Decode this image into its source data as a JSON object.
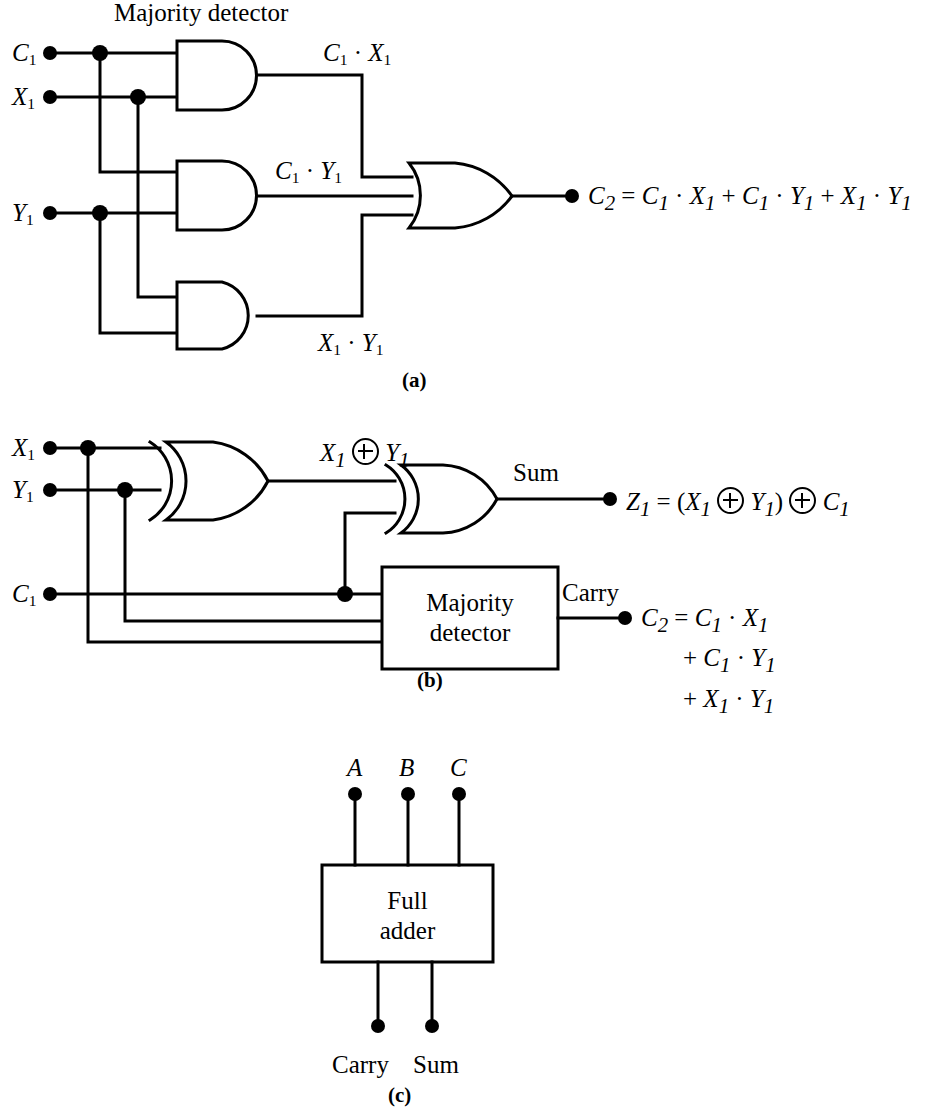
{
  "figure": {
    "title_a": "Majority detector",
    "parts": [
      {
        "id": "a",
        "label": "(a)"
      },
      {
        "id": "b",
        "label": "(b)"
      },
      {
        "id": "c",
        "label": "(c)"
      }
    ]
  },
  "part_a": {
    "heading": "Majority detector",
    "inputs": [
      {
        "name": "C",
        "sub": "1"
      },
      {
        "name": "X",
        "sub": "1"
      },
      {
        "name": "Y",
        "sub": "1"
      }
    ],
    "gates": [
      {
        "type": "AND",
        "output_label": "C₁ · X₁",
        "inputs": [
          "C₁",
          "X₁"
        ]
      },
      {
        "type": "AND",
        "output_label": "C₁ · Y₁",
        "inputs": [
          "C₁",
          "Y₁"
        ]
      },
      {
        "type": "AND",
        "output_label": "X₁ · Y₁",
        "inputs": [
          "X₁",
          "Y₁"
        ]
      },
      {
        "type": "OR",
        "output_label": "C₂",
        "inputs": [
          "C₁ · X₁",
          "C₁ · Y₁",
          "X₁ · Y₁"
        ]
      }
    ],
    "wire_labels": {
      "and1": {
        "a": "C",
        "a_sub": "1",
        "dot": "·",
        "b": "X",
        "b_sub": "1"
      },
      "and2": {
        "a": "C",
        "a_sub": "1",
        "dot": "·",
        "b": "Y",
        "b_sub": "1"
      },
      "and3": {
        "a": "X",
        "a_sub": "1",
        "dot": "·",
        "b": "Y",
        "b_sub": "1"
      }
    },
    "output_equation": {
      "lhs": "C",
      "lhs_sub": "2",
      "eq": "=",
      "terms": [
        {
          "a": "C",
          "a_sub": "1",
          "dot": "·",
          "b": "X",
          "b_sub": "1"
        },
        {
          "a": "C",
          "a_sub": "1",
          "dot": "·",
          "b": "Y",
          "b_sub": "1"
        },
        {
          "a": "X",
          "a_sub": "1",
          "dot": "·",
          "b": "Y",
          "b_sub": "1"
        }
      ],
      "plus": "+",
      "full_text": "C₂ = C₁ · X₁ + C₁ · Y₁ + X₁ · Y₁"
    },
    "part_label": "(a)"
  },
  "part_b": {
    "inputs": [
      {
        "name": "X",
        "sub": "1"
      },
      {
        "name": "Y",
        "sub": "1"
      },
      {
        "name": "C",
        "sub": "1"
      }
    ],
    "gates": [
      {
        "type": "XOR",
        "output_label": "X₁ ⊕ Y₁"
      },
      {
        "type": "XOR",
        "output_label": "Sum"
      }
    ],
    "block": {
      "line1": "Majority",
      "line2": "detector"
    },
    "wire_label_xor1": {
      "a": "X",
      "a_sub": "1",
      "b": "Y",
      "b_sub": "1"
    },
    "sum_label": "Sum",
    "carry_label": "Carry",
    "sum_equation": {
      "lhs": "Z",
      "lhs_sub": "1",
      "eq": "=",
      "open": "(",
      "x": "X",
      "x_sub": "1",
      "y": "Y",
      "y_sub": "1",
      "close": ")",
      "c": "C",
      "c_sub": "1",
      "full_text": "Z₁ = (X₁ ⊕ Y₁) ⊕ C₁"
    },
    "carry_equation": {
      "lhs": "C",
      "lhs_sub": "2",
      "eq": "=",
      "line1": {
        "a": "C",
        "a_sub": "1",
        "dot": "·",
        "b": "X",
        "b_sub": "1"
      },
      "line2": {
        "plus": "+",
        "a": "C",
        "a_sub": "1",
        "dot": "·",
        "b": "Y",
        "b_sub": "1"
      },
      "line3": {
        "plus": "+",
        "a": "X",
        "a_sub": "1",
        "dot": "·",
        "b": "Y",
        "b_sub": "1"
      },
      "full_text": "C₂ = C₁ · X₁ + C₁ · Y₁ + X₁ · Y₁"
    },
    "part_label": "(b)"
  },
  "part_c": {
    "inputs": [
      "A",
      "B",
      "C"
    ],
    "block": {
      "line1": "Full",
      "line2": "adder"
    },
    "outputs": [
      "Carry",
      "Sum"
    ],
    "part_label": "(c)"
  },
  "style": {
    "ink": "#000000",
    "paper": "#ffffff",
    "stroke_width": 3
  }
}
